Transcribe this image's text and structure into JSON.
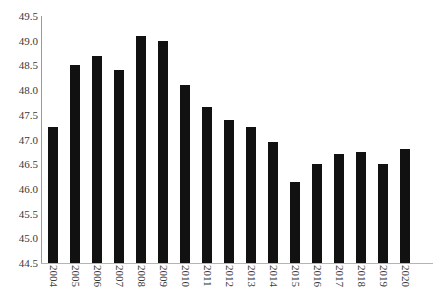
{
  "chart_data": {
    "type": "bar",
    "title": "",
    "subtitle": "",
    "xlabel": "",
    "ylabel": "",
    "categories": [
      "2004",
      "2005",
      "2006",
      "2007",
      "2008",
      "2009",
      "2010",
      "2011",
      "2012",
      "2013",
      "2014",
      "2015",
      "2016",
      "2017",
      "2018",
      "2019",
      "2020"
    ],
    "values": [
      47.25,
      48.5,
      48.7,
      48.4,
      49.1,
      49.0,
      48.1,
      47.65,
      47.4,
      47.25,
      46.95,
      46.15,
      46.5,
      46.7,
      46.75,
      46.5,
      46.8
    ],
    "series": [
      {
        "name": "",
        "values": [
          47.25,
          48.5,
          48.7,
          48.4,
          49.1,
          49.0,
          48.1,
          47.65,
          47.4,
          47.25,
          46.95,
          46.15,
          46.5,
          46.7,
          46.75,
          46.5,
          46.8
        ]
      }
    ],
    "ylim": [
      44.5,
      49.5
    ],
    "ytick_step": 0.5,
    "yticks": [
      44.5,
      45.0,
      45.5,
      46.0,
      46.5,
      47.0,
      47.5,
      48.0,
      48.5,
      49.0,
      49.5
    ],
    "ytick_labels": [
      "44.5",
      "45.0",
      "45.5",
      "46.0",
      "46.5",
      "47.0",
      "47.5",
      "48.0",
      "48.5",
      "49.0",
      "49.5"
    ],
    "grid": false,
    "legend": null,
    "legend_position": "none",
    "bar_color": "#111111",
    "axis_color": "#9a9a9a",
    "background_color": "#ffffff",
    "annotations": []
  }
}
